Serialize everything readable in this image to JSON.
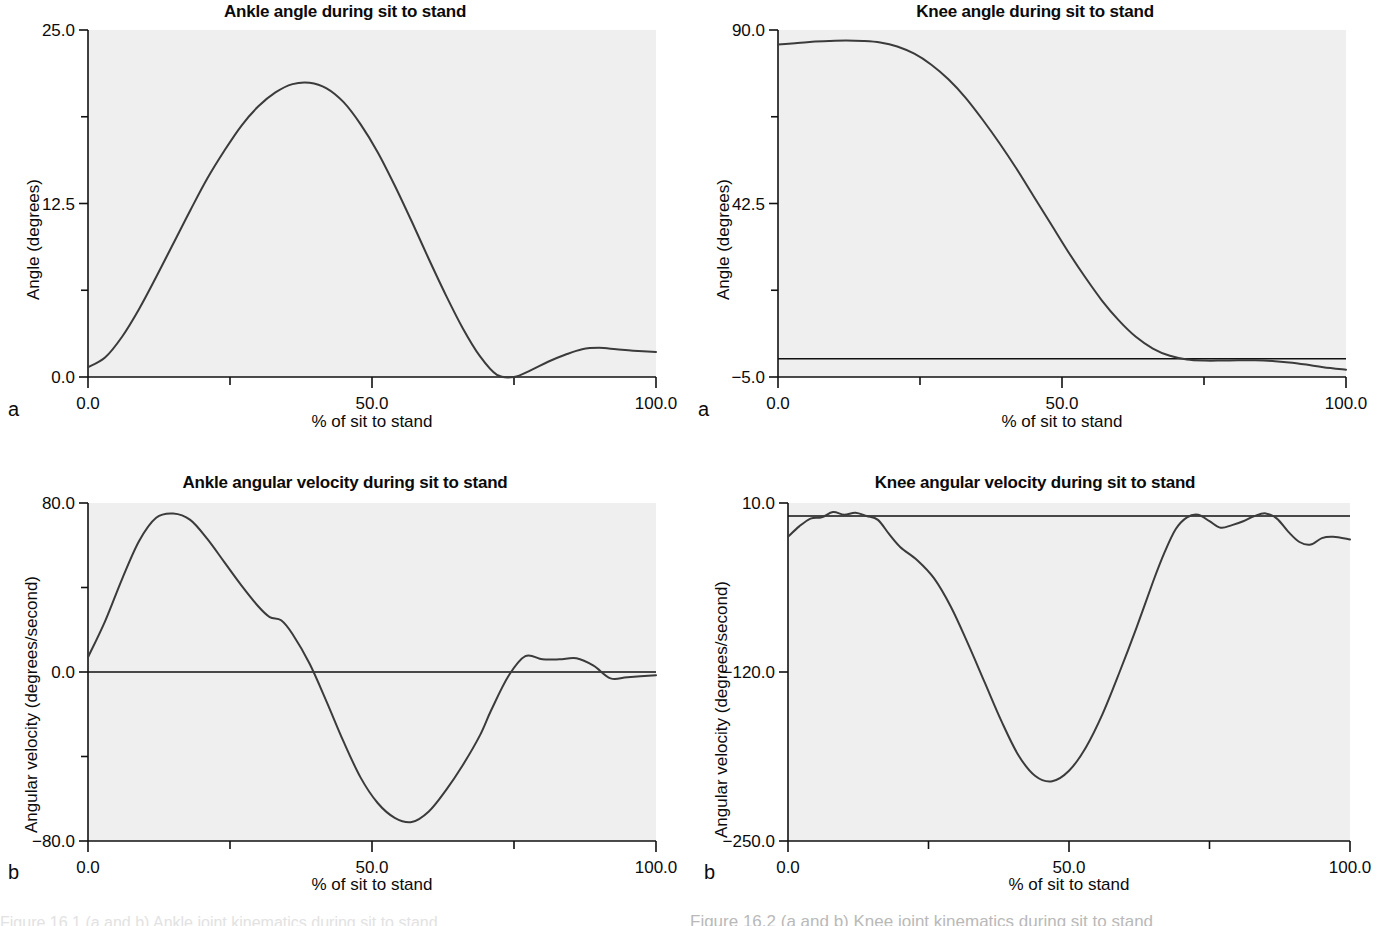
{
  "figure": {
    "panels": [
      {
        "letter": "a",
        "position": "top-left",
        "title": "Ankle angle during sit to stand",
        "xlabel": "% of sit to stand",
        "ylabel": "Angle (degrees)"
      },
      {
        "letter": "a",
        "position": "top-right",
        "title": "Knee angle during sit to stand",
        "xlabel": "% of sit to stand",
        "ylabel": "Angle (degrees)"
      },
      {
        "letter": "b",
        "position": "bottom-left",
        "title": "Ankle angular velocity during sit to stand",
        "xlabel": "% of sit to stand",
        "ylabel": "Angular velocity (degrees/second)"
      },
      {
        "letter": "b",
        "position": "bottom-right",
        "title": "Knee angular velocity during sit to stand",
        "xlabel": "% of sit to stand",
        "ylabel": "Angular velocity (degrees/second)"
      }
    ],
    "caption_partial": "Figure 16.2   (a and b) Knee joint kinematics during sit to stand",
    "caption_partial_left": "Figure 16.1   (a and b) Ankle joint kinematics during sit to stand"
  },
  "chart_data": [
    {
      "type": "line",
      "panel": "a",
      "position": "top-left",
      "title": "Ankle angle during sit to stand",
      "xlabel": "% of sit to stand",
      "ylabel": "Angle (degrees)",
      "xlim": [
        0,
        100
      ],
      "ylim": [
        0,
        25
      ],
      "xticks": [
        0,
        25,
        50,
        75,
        100
      ],
      "xticklabels": [
        "0.0",
        "",
        "50.0",
        "",
        "100.0"
      ],
      "yticks": [
        0,
        6.25,
        12.5,
        18.75,
        25
      ],
      "yticklabels": [
        "0.0",
        "",
        "12.5",
        "",
        "25.0"
      ],
      "grid": false,
      "legend": null,
      "zero_line": false,
      "x": [
        0,
        3,
        6,
        9,
        12,
        15,
        18,
        21,
        24,
        27,
        30,
        33,
        36,
        39,
        42,
        45,
        48,
        51,
        54,
        57,
        60,
        63,
        66,
        69,
        72,
        75,
        78,
        81,
        84,
        87,
        90,
        93,
        96,
        100
      ],
      "y": [
        0.7,
        1.4,
        2.9,
        4.9,
        7.2,
        9.6,
        12.0,
        14.3,
        16.3,
        18.1,
        19.5,
        20.5,
        21.1,
        21.2,
        20.8,
        19.8,
        18.2,
        16.2,
        13.8,
        11.2,
        8.5,
        5.9,
        3.5,
        1.5,
        0.15,
        0.0,
        0.5,
        1.1,
        1.6,
        2.0,
        2.1,
        2.0,
        1.9,
        1.8
      ]
    },
    {
      "type": "line",
      "panel": "a",
      "position": "top-right",
      "title": "Knee angle during sit to stand",
      "xlabel": "% of sit to stand",
      "ylabel": "Angle (degrees)",
      "xlim": [
        0,
        100
      ],
      "ylim": [
        -5,
        90
      ],
      "xticks": [
        0,
        25,
        50,
        75,
        100
      ],
      "xticklabels": [
        "0.0",
        "",
        "50.0",
        "",
        "100.0"
      ],
      "yticks": [
        -5,
        18.75,
        42.5,
        66.25,
        90
      ],
      "yticklabels": [
        "-5.0",
        "",
        "42.5",
        "",
        "90.0"
      ],
      "grid": false,
      "legend": null,
      "zero_line": true,
      "zero_line_value": 0.0,
      "x": [
        0,
        3,
        6,
        9,
        12,
        15,
        18,
        21,
        24,
        27,
        30,
        33,
        36,
        39,
        42,
        45,
        48,
        51,
        54,
        57,
        60,
        63,
        66,
        69,
        72,
        75,
        78,
        81,
        84,
        87,
        90,
        93,
        96,
        100
      ],
      "y": [
        86.0,
        86.4,
        86.8,
        87.0,
        87.1,
        87.0,
        86.6,
        85.5,
        83.5,
        80.5,
        76.5,
        71.5,
        65.5,
        59.0,
        52.0,
        44.5,
        37.0,
        29.5,
        22.5,
        16.0,
        10.5,
        6.0,
        2.8,
        0.8,
        -0.2,
        -0.5,
        -0.5,
        -0.4,
        -0.4,
        -0.6,
        -1.0,
        -1.6,
        -2.3,
        -3.0
      ]
    },
    {
      "type": "line",
      "panel": "b",
      "position": "bottom-left",
      "title": "Ankle angular velocity during sit to stand",
      "xlabel": "% of sit to stand",
      "ylabel": "Angular velocity (degrees/second)",
      "xlim": [
        0,
        100
      ],
      "ylim": [
        -80,
        80
      ],
      "xticks": [
        0,
        25,
        50,
        75,
        100
      ],
      "xticklabels": [
        "0.0",
        "",
        "50.0",
        "",
        "100.0"
      ],
      "yticks": [
        -80,
        -40,
        0,
        40,
        80
      ],
      "yticklabels": [
        "-80.0",
        "",
        "0.0",
        "",
        "80.0"
      ],
      "grid": false,
      "legend": null,
      "zero_line": true,
      "zero_line_value": 0.0,
      "x": [
        0,
        3,
        6,
        9,
        12,
        15,
        18,
        21,
        24,
        27,
        30,
        32,
        34,
        36,
        39,
        42,
        45,
        48,
        51,
        54,
        57,
        60,
        63,
        66,
        69,
        71,
        74,
        77,
        80,
        83,
        86,
        89,
        92,
        95,
        100
      ],
      "y": [
        7.0,
        24.0,
        44.0,
        62.0,
        73.0,
        75.0,
        72.0,
        63.0,
        52.0,
        41.0,
        31.0,
        26.0,
        24.5,
        18.0,
        4.0,
        -14.0,
        -33.0,
        -50.0,
        -62.0,
        -69.0,
        -71.0,
        -66.0,
        -56.0,
        -44.0,
        -30.0,
        -18.0,
        -2.0,
        7.5,
        6.0,
        6.0,
        6.5,
        3.0,
        -3.0,
        -2.5,
        -1.5
      ]
    },
    {
      "type": "line",
      "panel": "b",
      "position": "bottom-right",
      "title": "Knee angular velocity during sit to stand",
      "xlabel": "% of sit to stand",
      "ylabel": "Angular velocity (degrees/second)",
      "xlim": [
        0,
        100
      ],
      "ylim": [
        -250,
        10
      ],
      "xticks": [
        0,
        25,
        50,
        75,
        100
      ],
      "xticklabels": [
        "0.0",
        "",
        "50.0",
        "",
        "100.0"
      ],
      "yticks": [
        -250,
        -120,
        10
      ],
      "yticklabels": [
        "-250.0",
        "-120.0",
        "10.0"
      ],
      "grid": false,
      "legend": null,
      "zero_line": true,
      "zero_line_value": 0.0,
      "x": [
        0,
        2,
        4,
        6,
        8,
        10,
        12,
        14,
        16,
        18,
        20,
        23,
        26,
        29,
        32,
        35,
        38,
        41,
        44,
        47,
        50,
        53,
        56,
        59,
        62,
        65,
        67,
        69,
        71,
        73,
        75,
        77,
        79,
        81,
        83,
        85,
        87,
        89,
        91,
        93,
        95,
        97,
        100
      ],
      "y": [
        -16.0,
        -8.0,
        -2.0,
        -1.0,
        3.0,
        1.0,
        2.5,
        0.0,
        -3.0,
        -14.0,
        -24.0,
        -34.0,
        -48.0,
        -70.0,
        -98.0,
        -128.0,
        -158.0,
        -184.0,
        -200.0,
        -204.0,
        -196.0,
        -178.0,
        -152.0,
        -120.0,
        -86.0,
        -50.0,
        -28.0,
        -10.0,
        -1.0,
        1.0,
        -4.0,
        -9.0,
        -7.0,
        -4.0,
        0.0,
        2.0,
        -2.0,
        -12.0,
        -20.0,
        -22.0,
        -17.0,
        -16.0,
        -18.0
      ]
    }
  ]
}
